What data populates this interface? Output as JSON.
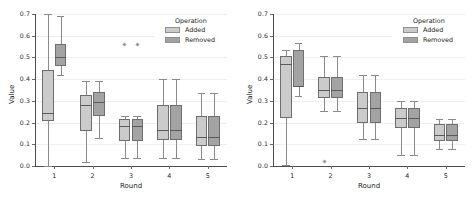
{
  "figure": {
    "panels": [
      {
        "id": "left",
        "legend": {
          "title": "Operation",
          "entries": [
            {
              "label": "Added",
              "color": "#cbcbcb"
            },
            {
              "label": "Removed",
              "color": "#a3a3a3"
            }
          ]
        }
      },
      {
        "id": "right",
        "legend": {
          "title": "Operation",
          "entries": [
            {
              "label": "Added",
              "color": "#cbcbcb"
            },
            {
              "label": "Removed",
              "color": "#a3a3a3"
            }
          ]
        }
      }
    ]
  },
  "chart_data": [
    {
      "type": "box",
      "panel": "left",
      "title": "",
      "xlabel": "Round",
      "ylabel": "Value",
      "categories": [
        "1",
        "2",
        "3",
        "4",
        "5"
      ],
      "ylim": [
        0.0,
        0.7
      ],
      "yticks": [
        0.0,
        0.1,
        0.2,
        0.3,
        0.4,
        0.5,
        0.6,
        0.7
      ],
      "ytick_labels": [
        "0.0",
        "0.1",
        "0.2",
        "0.3",
        "0.4",
        "0.5",
        "0.6",
        "0.7"
      ],
      "grid": true,
      "legend_title": "Operation",
      "legend_position": "upper right",
      "series": [
        {
          "name": "Added",
          "color": "#cbcbcb",
          "boxes": [
            {
              "category": "1",
              "whisker_low": 0.0,
              "q1": 0.207,
              "median": 0.245,
              "q3": 0.443,
              "whisker_high": 0.7,
              "fliers": []
            },
            {
              "category": "2",
              "whisker_low": 0.02,
              "q1": 0.16,
              "median": 0.283,
              "q3": 0.325,
              "whisker_high": 0.39,
              "fliers": []
            },
            {
              "category": "3",
              "whisker_low": 0.038,
              "q1": 0.113,
              "median": 0.183,
              "q3": 0.218,
              "whisker_high": 0.228,
              "fliers": [
                0.56
              ]
            },
            {
              "category": "4",
              "whisker_low": 0.035,
              "q1": 0.118,
              "median": 0.165,
              "q3": 0.283,
              "whisker_high": 0.4,
              "fliers": []
            },
            {
              "category": "5",
              "whisker_low": 0.033,
              "q1": 0.09,
              "median": 0.135,
              "q3": 0.23,
              "whisker_high": 0.338,
              "fliers": []
            }
          ]
        },
        {
          "name": "Removed",
          "color": "#a3a3a3",
          "boxes": [
            {
              "category": "1",
              "whisker_low": 0.42,
              "q1": 0.46,
              "median": 0.5,
              "q3": 0.563,
              "whisker_high": 0.69,
              "fliers": []
            },
            {
              "category": "2",
              "whisker_low": 0.13,
              "q1": 0.228,
              "median": 0.293,
              "q3": 0.34,
              "whisker_high": 0.39,
              "fliers": []
            },
            {
              "category": "3",
              "whisker_low": 0.038,
              "q1": 0.113,
              "median": 0.183,
              "q3": 0.218,
              "whisker_high": 0.228,
              "fliers": [
                0.56
              ]
            },
            {
              "category": "4",
              "whisker_low": 0.035,
              "q1": 0.118,
              "median": 0.165,
              "q3": 0.283,
              "whisker_high": 0.4,
              "fliers": []
            },
            {
              "category": "5",
              "whisker_low": 0.033,
              "q1": 0.09,
              "median": 0.135,
              "q3": 0.23,
              "whisker_high": 0.338,
              "fliers": []
            }
          ]
        }
      ]
    },
    {
      "type": "box",
      "panel": "right",
      "title": "",
      "xlabel": "Round",
      "ylabel": "Value",
      "categories": [
        "1",
        "2",
        "3",
        "4",
        "5"
      ],
      "ylim": [
        0.0,
        0.7
      ],
      "yticks": [
        0.0,
        0.1,
        0.2,
        0.3,
        0.4,
        0.5,
        0.6,
        0.7
      ],
      "ytick_labels": [
        "0.0",
        "0.1",
        "0.2",
        "0.3",
        "0.4",
        "0.5",
        "0.6",
        "0.7"
      ],
      "grid": true,
      "legend_title": "Operation",
      "legend_position": "upper right",
      "series": [
        {
          "name": "Added",
          "color": "#cbcbcb",
          "boxes": [
            {
              "category": "1",
              "whisker_low": 0.005,
              "q1": 0.223,
              "median": 0.468,
              "q3": 0.508,
              "whisker_high": 0.535,
              "fliers": []
            },
            {
              "category": "2",
              "whisker_low": 0.255,
              "q1": 0.313,
              "median": 0.35,
              "q3": 0.408,
              "whisker_high": 0.508,
              "fliers": [
                0.02
              ]
            },
            {
              "category": "3",
              "whisker_low": 0.123,
              "q1": 0.198,
              "median": 0.265,
              "q3": 0.34,
              "whisker_high": 0.42,
              "fliers": []
            },
            {
              "category": "4",
              "whisker_low": 0.05,
              "q1": 0.175,
              "median": 0.223,
              "q3": 0.268,
              "whisker_high": 0.298,
              "fliers": []
            },
            {
              "category": "5",
              "whisker_low": 0.078,
              "q1": 0.113,
              "median": 0.145,
              "q3": 0.193,
              "whisker_high": 0.218,
              "fliers": []
            }
          ]
        },
        {
          "name": "Removed",
          "color": "#a3a3a3",
          "boxes": [
            {
              "category": "1",
              "whisker_low": 0.323,
              "q1": 0.363,
              "median": 0.368,
              "q3": 0.535,
              "whisker_high": 0.565,
              "fliers": []
            },
            {
              "category": "2",
              "whisker_low": 0.255,
              "q1": 0.313,
              "median": 0.35,
              "q3": 0.408,
              "whisker_high": 0.508,
              "fliers": []
            },
            {
              "category": "3",
              "whisker_low": 0.123,
              "q1": 0.198,
              "median": 0.265,
              "q3": 0.34,
              "whisker_high": 0.42,
              "fliers": []
            },
            {
              "category": "4",
              "whisker_low": 0.05,
              "q1": 0.175,
              "median": 0.223,
              "q3": 0.268,
              "whisker_high": 0.298,
              "fliers": []
            },
            {
              "category": "5",
              "whisker_low": 0.078,
              "q1": 0.113,
              "median": 0.145,
              "q3": 0.193,
              "whisker_high": 0.218,
              "fliers": []
            }
          ]
        }
      ]
    }
  ]
}
